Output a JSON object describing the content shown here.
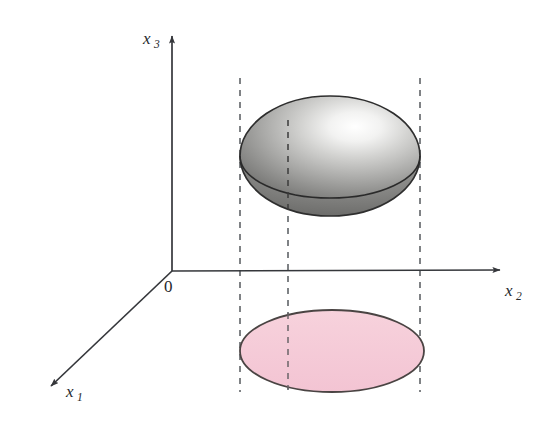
{
  "figure": {
    "title": "",
    "background_color": "#ffffff",
    "axes": {
      "origin_label": "0",
      "items": [
        {
          "name": "x1",
          "label_base": "x",
          "label_sub": "1",
          "direction": "down-left",
          "from": [
            172,
            271
          ],
          "to": [
            46,
            391
          ],
          "label_pos": [
            66,
            397
          ]
        },
        {
          "name": "x2",
          "label_base": "x",
          "label_sub": "2",
          "direction": "right",
          "from": [
            172,
            271
          ],
          "to": [
            505,
            270
          ],
          "label_pos": [
            505,
            296
          ]
        },
        {
          "name": "x3",
          "label_base": "x",
          "label_sub": "3",
          "direction": "up",
          "from": [
            172,
            271
          ],
          "to": [
            172,
            32
          ],
          "label_pos": [
            143,
            44
          ]
        }
      ],
      "origin_pos": [
        163,
        290
      ],
      "axis_color": "#3a3c40"
    },
    "ellipsoid": {
      "semantic": "shaded-3d-ellipsoid",
      "center": [
        330,
        156
      ],
      "rx": 90,
      "ry": 60,
      "equator_y": 198,
      "bottom_y": 215,
      "outline_color": "#2e2e2e",
      "fill_light": "#ffffff",
      "fill_mid": "#b9b9b7",
      "fill_dark": "#6f6f6d",
      "highlight_pos": [
        368,
        122
      ]
    },
    "projection_ellipse": {
      "semantic": "pink-shadow-ellipse",
      "center": [
        332,
        351
      ],
      "rx": 92,
      "ry": 41,
      "fill_color": "#f6ccd8",
      "outline_color": "#4a4443"
    },
    "dashed_lines": [
      {
        "name": "left-projector",
        "x": 240,
        "y_top": 78,
        "y_bottom": 392
      },
      {
        "name": "center-projector",
        "x": 288,
        "y_top": 120,
        "y_bottom": 392
      },
      {
        "name": "right-projector",
        "x": 420,
        "y_top": 78,
        "y_bottom": 392
      }
    ],
    "dash_color": "#55595e"
  }
}
